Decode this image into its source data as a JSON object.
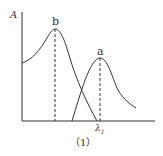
{
  "diagram": {
    "y_axis_label": "A",
    "x_tick_label": "λ",
    "x_tick_subscript": "1",
    "caption": "（1）",
    "peaks": [
      {
        "name": "b",
        "label": "b"
      },
      {
        "name": "a",
        "label": "a"
      }
    ],
    "colors": {
      "line": "#333333",
      "background": "#ffffff"
    }
  }
}
